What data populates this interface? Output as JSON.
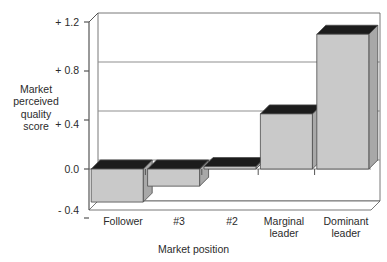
{
  "chart_data": {
    "type": "bar",
    "title": "",
    "xlabel": "Market position",
    "ylabel": "Market perceived quality score",
    "ylabel_lines": "Market\nperceived\nquality\nscore",
    "categories": [
      "Follower",
      "#3",
      "#2",
      "Marginal leader",
      "Dominant leader"
    ],
    "category_lines": [
      "Follower",
      "#3",
      "#2",
      "Marginal\nleader",
      "Dominant\nleader"
    ],
    "values": [
      -0.27,
      -0.14,
      0.02,
      0.45,
      1.1
    ],
    "ylim": [
      -0.4,
      1.2
    ],
    "yticks": [
      1.2,
      0.8,
      0.4,
      0.0,
      -0.4
    ],
    "ytick_labels": [
      "+ 1.2",
      "+ 0.8",
      "+ 0.4",
      "0.0",
      "- 0.4"
    ],
    "gridlines": [
      0.8,
      0.4
    ],
    "grid": true,
    "legend": null,
    "style": "3d-isometric-bars"
  },
  "colors": {
    "bar_face": "#c9c9c9",
    "bar_top": "#1c1c1c",
    "bar_side": "#a8a8a8",
    "bar_outline": "#4a4a4a",
    "axis": "#555555",
    "grid": "#8f8f8f",
    "text": "#2b2b2b",
    "background": "#ffffff"
  }
}
